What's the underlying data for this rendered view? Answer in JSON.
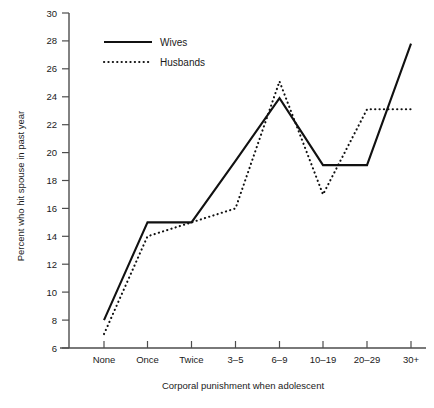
{
  "chart_data": {
    "type": "line",
    "title": "",
    "xlabel": "Corporal punishment when adolescent",
    "ylabel": "Percent who hit spouse in past year",
    "categories": [
      "None",
      "Once",
      "Twice",
      "3–5",
      "6–9",
      "10–19",
      "20–29",
      "30+"
    ],
    "series": [
      {
        "name": "Wives",
        "style": "solid",
        "values": [
          8.0,
          15.0,
          15.0,
          19.4,
          23.9,
          19.1,
          19.1,
          27.8
        ]
      },
      {
        "name": "Husbands",
        "style": "dotted",
        "values": [
          7.0,
          14.0,
          15.0,
          16.0,
          25.1,
          17.0,
          23.1,
          23.1
        ]
      }
    ],
    "ylim": [
      6,
      30
    ],
    "yticks": [
      6,
      8,
      10,
      12,
      14,
      16,
      18,
      20,
      22,
      24,
      26,
      28,
      30
    ],
    "grid": false,
    "legend_position": "top-left",
    "legend": [
      {
        "label": "Wives",
        "style": "solid"
      },
      {
        "label": "Husbands",
        "style": "dotted"
      }
    ]
  },
  "axis": {
    "y_tick_labels": [
      "30",
      "28",
      "26",
      "24",
      "22",
      "20",
      "18",
      "16",
      "14",
      "12",
      "10",
      "8",
      "6"
    ],
    "x_tick_labels": [
      "None",
      "Once",
      "Twice",
      "3–5",
      "6–9",
      "10–19",
      "20–29",
      "30+"
    ],
    "y_title": "Percent who hit spouse in past year",
    "x_title": "Corporal punishment when adolescent"
  },
  "legend": {
    "wives_label": "Wives",
    "husbands_label": "Husbands"
  },
  "colors": {
    "line": "#111111",
    "axis": "#4d4d4d",
    "text": "#1a1a1a",
    "background": "#ffffff"
  }
}
